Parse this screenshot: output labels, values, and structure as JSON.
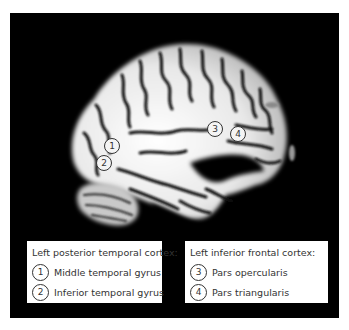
{
  "figure": {
    "type": "sagittal brain MRI with labeled regions",
    "background_color": "#000000",
    "markers": [
      {
        "num": "1",
        "label": "Middle temporal gyrus"
      },
      {
        "num": "2",
        "label": "Inferior temporal gyrus"
      },
      {
        "num": "3",
        "label": "Pars opercularis"
      },
      {
        "num": "4",
        "label": "Pars triangularis"
      }
    ]
  },
  "legend_left": {
    "title": "Left posterior temporal cortex:",
    "items": [
      {
        "num": "1",
        "label": "Middle temporal gyrus"
      },
      {
        "num": "2",
        "label": "Inferior temporal gyrus"
      }
    ]
  },
  "legend_right": {
    "title": "Left inferior frontal cortex:",
    "items": [
      {
        "num": "3",
        "label": "Pars opercularis"
      },
      {
        "num": "4",
        "label": "Pars triangularis"
      }
    ]
  }
}
